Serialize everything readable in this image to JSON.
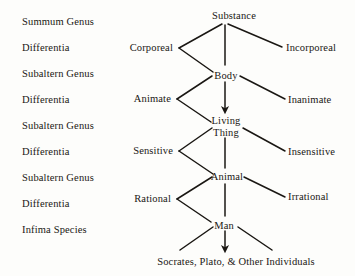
{
  "diagram": {
    "background_color": "#fdfdfb",
    "ink_color": "#1a1713",
    "left_column": [
      {
        "label": "Summum Genus",
        "x": 22,
        "y": 16
      },
      {
        "label": "Differentia",
        "x": 22,
        "y": 42
      },
      {
        "label": "Subaltern Genus",
        "x": 22,
        "y": 68
      },
      {
        "label": "Differentia",
        "x": 22,
        "y": 94
      },
      {
        "label": "Subaltern Genus",
        "x": 22,
        "y": 120
      },
      {
        "label": "Differentia",
        "x": 22,
        "y": 146
      },
      {
        "label": "Subaltern Genus",
        "x": 22,
        "y": 172
      },
      {
        "label": "Differentia",
        "x": 22,
        "y": 198
      },
      {
        "label": "Infima Species",
        "x": 22,
        "y": 224
      }
    ],
    "spine_nodes": [
      {
        "label": "Substance",
        "x": 234,
        "y": 10
      },
      {
        "label": "Body",
        "x": 221,
        "y": 71
      },
      {
        "label": "Living\nThing",
        "x": 224,
        "y": 116,
        "line1": "Living",
        "line2": "Thing"
      },
      {
        "label": "Animal",
        "x": 224,
        "y": 172
      },
      {
        "label": "Man",
        "x": 221,
        "y": 221
      }
    ],
    "left_branches": [
      {
        "label": "Corporeal",
        "x": 175,
        "y": 42
      },
      {
        "label": "Animate",
        "x": 172,
        "y": 94
      },
      {
        "label": "Sensitive",
        "x": 175,
        "y": 146
      },
      {
        "label": "Rational",
        "x": 172,
        "y": 194
      }
    ],
    "right_branches": [
      {
        "label": "Incorporeal",
        "x": 285,
        "y": 44
      },
      {
        "label": "Inanimate",
        "x": 288,
        "y": 96
      },
      {
        "label": "Insensitive",
        "x": 288,
        "y": 148
      },
      {
        "label": "Irrational",
        "x": 288,
        "y": 192
      }
    ],
    "bottom_row": {
      "label": "Socrates, Plato, & Other Individuals",
      "x": 236,
      "y": 258
    }
  }
}
